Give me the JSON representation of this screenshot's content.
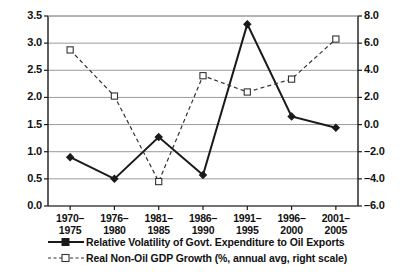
{
  "chart_data": {
    "type": "line",
    "title": "",
    "xlabel": "",
    "categories": [
      "1970–\n1975",
      "1976–\n1980",
      "1981–\n1985",
      "1986–\n1990",
      "1991–\n1995",
      "1996–\n2000",
      "2001–\n2005"
    ],
    "category_lines": [
      [
        "1970–",
        "1975"
      ],
      [
        "1976–",
        "1980"
      ],
      [
        "1981–",
        "1985"
      ],
      [
        "1986–",
        "1990"
      ],
      [
        "1991–",
        "1995"
      ],
      [
        "1996–",
        "2000"
      ],
      [
        "2001–",
        "2005"
      ]
    ],
    "grid": true,
    "legend_position": "bottom",
    "left_axis": {
      "label": "",
      "ylim": [
        0.0,
        3.5
      ],
      "ticks": [
        "0.0",
        "0.5",
        "1.0",
        "1.5",
        "2.0",
        "2.5",
        "3.0",
        "3.5"
      ],
      "tick_values": [
        0.0,
        0.5,
        1.0,
        1.5,
        2.0,
        2.5,
        3.0,
        3.5
      ]
    },
    "right_axis": {
      "label": "",
      "ylim": [
        -6.0,
        8.0
      ],
      "ticks": [
        "–6.0",
        "–4.0",
        "–2.0",
        "0.0",
        "2.0",
        "4.0",
        "6.0",
        "8.0"
      ],
      "tick_values": [
        -6.0,
        -4.0,
        -2.0,
        0.0,
        2.0,
        4.0,
        6.0,
        8.0
      ]
    },
    "series": [
      {
        "name": "Relative Volatility of Govt. Expenditure to Oil Exports",
        "axis": "left",
        "style": "solid",
        "marker": "filled-diamond",
        "color": "#1a1a1a",
        "values": [
          0.9,
          0.5,
          1.27,
          0.57,
          3.35,
          1.65,
          1.44
        ]
      },
      {
        "name": "Real Non-Oil GDP Growth (%, annual avg, right scale)",
        "axis": "right",
        "style": "dashed",
        "marker": "open-square",
        "color": "#333333",
        "values": [
          5.5,
          2.1,
          -4.2,
          3.6,
          2.4,
          3.35,
          6.3
        ]
      }
    ]
  },
  "legend": {
    "items": [
      {
        "label": "Relative Volatility of Govt. Expenditure to Oil Exports",
        "key": "solid-line-filled-square-key"
      },
      {
        "label": "Real Non-Oil GDP Growth (%, annual avg, right scale)",
        "key": "dashed-line-open-square-key"
      }
    ]
  },
  "colors": {
    "axis": "#1a1a1a",
    "gridline": "#9a9a9a",
    "series1": "#1a1a1a",
    "series2": "#333333",
    "background": "#ffffff"
  }
}
